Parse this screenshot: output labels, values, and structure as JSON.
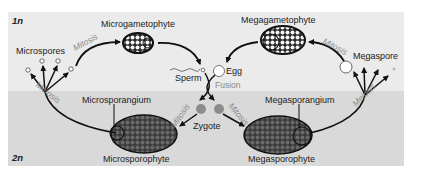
{
  "diagram": {
    "regions": {
      "haploid": {
        "label": "1n",
        "color": "#ebebeb"
      },
      "diploid": {
        "label": "2n",
        "color": "#d8d8d8"
      }
    },
    "nodes": {
      "microspores": "Microspores",
      "microgametophyte": "Microgametophyte",
      "sperm": "Sperm",
      "egg": "Egg",
      "megagametophyte": "Megagametophyte",
      "megaspore": "Megaspore",
      "microsporangium": "Microsporangium",
      "microsporophyte": "Microsporophyte",
      "zygote": "Zygote",
      "megasporangium": "Megasporangium",
      "megasporophyte": "Megasporophyte"
    },
    "processes": {
      "mitosis_micro": "Mitosis",
      "mitosis_mega": "Mitosis",
      "fusion": "Fusion",
      "mitosis_zygote_left": "Mitosis",
      "mitosis_zygote_right": "Mitosis",
      "meiosis_left": "Meiosis",
      "meiosis_right": "Meiosis"
    },
    "colors": {
      "arrow": "#111111",
      "zygote": "#8c8c8c",
      "sporophyte_fill": "#5a5a5a",
      "process_text": "#8a8a8a"
    }
  }
}
